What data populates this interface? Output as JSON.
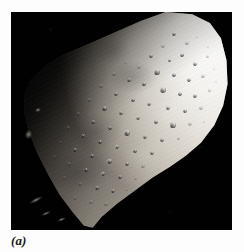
{
  "figure": {
    "caption_label": "(a)",
    "frame": {
      "x": 11,
      "y": 12,
      "width": 221,
      "height": 218
    },
    "colors": {
      "page_background": "#ffffff",
      "sky_black": "#010101",
      "limb_highlight": "#f4f2ee",
      "midtone_regolith": "#b9b3a8",
      "terminator_shadow": "#0c0b0a",
      "caption_text": "#161616"
    },
    "lighting": {
      "sun_direction": "upper-right",
      "terminator_side": "lower-left"
    },
    "craters": [
      {
        "x": 163,
        "y": 22,
        "d": 4.0,
        "class": ""
      },
      {
        "x": 176,
        "y": 31,
        "d": 3.2,
        "class": "dim"
      },
      {
        "x": 186,
        "y": 25,
        "d": 2.6,
        "class": "faint"
      },
      {
        "x": 152,
        "y": 34,
        "d": 3.4,
        "class": "dim"
      },
      {
        "x": 140,
        "y": 44,
        "d": 4.6,
        "class": ""
      },
      {
        "x": 158,
        "y": 48,
        "d": 3.0,
        "class": ""
      },
      {
        "x": 171,
        "y": 43,
        "d": 3.6,
        "class": "bright-rim"
      },
      {
        "x": 184,
        "y": 52,
        "d": 4.2,
        "class": ""
      },
      {
        "x": 196,
        "y": 44,
        "d": 3.0,
        "class": "dim"
      },
      {
        "x": 128,
        "y": 55,
        "d": 3.8,
        "class": "dim"
      },
      {
        "x": 114,
        "y": 50,
        "d": 3.0,
        "class": "faint"
      },
      {
        "x": 146,
        "y": 60,
        "d": 5.2,
        "class": "bright-rim"
      },
      {
        "x": 163,
        "y": 63,
        "d": 3.4,
        "class": ""
      },
      {
        "x": 178,
        "y": 68,
        "d": 4.0,
        "class": ""
      },
      {
        "x": 192,
        "y": 64,
        "d": 3.2,
        "class": "dim"
      },
      {
        "x": 203,
        "y": 57,
        "d": 2.8,
        "class": "faint"
      },
      {
        "x": 103,
        "y": 62,
        "d": 3.6,
        "class": "dim"
      },
      {
        "x": 118,
        "y": 68,
        "d": 4.4,
        "class": ""
      },
      {
        "x": 133,
        "y": 72,
        "d": 3.2,
        "class": ""
      },
      {
        "x": 152,
        "y": 78,
        "d": 5.6,
        "class": "bright-rim"
      },
      {
        "x": 169,
        "y": 82,
        "d": 3.6,
        "class": ""
      },
      {
        "x": 184,
        "y": 84,
        "d": 4.4,
        "class": ""
      },
      {
        "x": 198,
        "y": 78,
        "d": 3.0,
        "class": "dim"
      },
      {
        "x": 90,
        "y": 74,
        "d": 3.2,
        "class": "dim"
      },
      {
        "x": 105,
        "y": 82,
        "d": 4.8,
        "class": ""
      },
      {
        "x": 122,
        "y": 88,
        "d": 3.4,
        "class": ""
      },
      {
        "x": 138,
        "y": 92,
        "d": 4.2,
        "class": "bright-rim"
      },
      {
        "x": 157,
        "y": 96,
        "d": 3.8,
        "class": ""
      },
      {
        "x": 174,
        "y": 99,
        "d": 4.6,
        "class": ""
      },
      {
        "x": 190,
        "y": 96,
        "d": 3.2,
        "class": "dim"
      },
      {
        "x": 78,
        "y": 88,
        "d": 3.6,
        "class": "dim"
      },
      {
        "x": 93,
        "y": 96,
        "d": 5.0,
        "class": ""
      },
      {
        "x": 110,
        "y": 101,
        "d": 3.4,
        "class": ""
      },
      {
        "x": 127,
        "y": 106,
        "d": 4.4,
        "class": "bright-rim"
      },
      {
        "x": 145,
        "y": 110,
        "d": 3.6,
        "class": ""
      },
      {
        "x": 162,
        "y": 113,
        "d": 5.2,
        "class": ""
      },
      {
        "x": 179,
        "y": 112,
        "d": 3.4,
        "class": "dim"
      },
      {
        "x": 67,
        "y": 102,
        "d": 3.2,
        "class": "dim"
      },
      {
        "x": 82,
        "y": 110,
        "d": 4.2,
        "class": ""
      },
      {
        "x": 99,
        "y": 116,
        "d": 3.6,
        "class": ""
      },
      {
        "x": 116,
        "y": 121,
        "d": 5.4,
        "class": "bright-rim"
      },
      {
        "x": 134,
        "y": 125,
        "d": 3.8,
        "class": ""
      },
      {
        "x": 151,
        "y": 128,
        "d": 4.4,
        "class": ""
      },
      {
        "x": 167,
        "y": 126,
        "d": 3.0,
        "class": "dim"
      },
      {
        "x": 57,
        "y": 116,
        "d": 3.4,
        "class": "dim"
      },
      {
        "x": 72,
        "y": 124,
        "d": 4.6,
        "class": ""
      },
      {
        "x": 89,
        "y": 130,
        "d": 3.4,
        "class": ""
      },
      {
        "x": 106,
        "y": 135,
        "d": 4.8,
        "class": "bright-rim"
      },
      {
        "x": 124,
        "y": 139,
        "d": 3.6,
        "class": ""
      },
      {
        "x": 141,
        "y": 141,
        "d": 4.0,
        "class": ""
      },
      {
        "x": 49,
        "y": 130,
        "d": 3.0,
        "class": "dim"
      },
      {
        "x": 64,
        "y": 138,
        "d": 4.2,
        "class": ""
      },
      {
        "x": 81,
        "y": 144,
        "d": 3.4,
        "class": ""
      },
      {
        "x": 98,
        "y": 149,
        "d": 5.0,
        "class": "bright-rim"
      },
      {
        "x": 116,
        "y": 152,
        "d": 3.8,
        "class": ""
      },
      {
        "x": 132,
        "y": 154,
        "d": 3.2,
        "class": "dim"
      },
      {
        "x": 43,
        "y": 145,
        "d": 3.2,
        "class": "faint"
      },
      {
        "x": 58,
        "y": 152,
        "d": 4.0,
        "class": "dim"
      },
      {
        "x": 75,
        "y": 158,
        "d": 3.6,
        "class": ""
      },
      {
        "x": 92,
        "y": 162,
        "d": 4.6,
        "class": "bright-rim"
      },
      {
        "x": 109,
        "y": 165,
        "d": 3.4,
        "class": ""
      },
      {
        "x": 124,
        "y": 166,
        "d": 3.0,
        "class": "dim"
      },
      {
        "x": 53,
        "y": 166,
        "d": 3.4,
        "class": "faint"
      },
      {
        "x": 69,
        "y": 172,
        "d": 4.2,
        "class": "dim"
      },
      {
        "x": 86,
        "y": 176,
        "d": 3.6,
        "class": ""
      },
      {
        "x": 102,
        "y": 179,
        "d": 4.0,
        "class": ""
      },
      {
        "x": 116,
        "y": 178,
        "d": 2.8,
        "class": "dim"
      },
      {
        "x": 64,
        "y": 186,
        "d": 3.2,
        "class": "faint"
      },
      {
        "x": 80,
        "y": 190,
        "d": 3.8,
        "class": "dim"
      },
      {
        "x": 95,
        "y": 192,
        "d": 3.2,
        "class": "dim"
      },
      {
        "x": 107,
        "y": 190,
        "d": 2.6,
        "class": "faint"
      },
      {
        "x": 197,
        "y": 35,
        "d": 2.4,
        "class": "faint"
      },
      {
        "x": 205,
        "y": 70,
        "d": 2.6,
        "class": "faint"
      },
      {
        "x": 193,
        "y": 110,
        "d": 2.8,
        "class": "faint"
      }
    ],
    "shadow_glints": [
      {
        "x": 18,
        "y": 186,
        "w": 14,
        "h": 4,
        "rot": -28
      },
      {
        "x": 30,
        "y": 200,
        "w": 10,
        "h": 3,
        "rot": -24
      },
      {
        "x": 14,
        "y": 118,
        "w": 7,
        "h": 9,
        "rot": 12
      },
      {
        "x": 24,
        "y": 96,
        "w": 6,
        "h": 4,
        "rot": -18
      },
      {
        "x": 46,
        "y": 206,
        "w": 9,
        "h": 3,
        "rot": -20
      }
    ]
  }
}
